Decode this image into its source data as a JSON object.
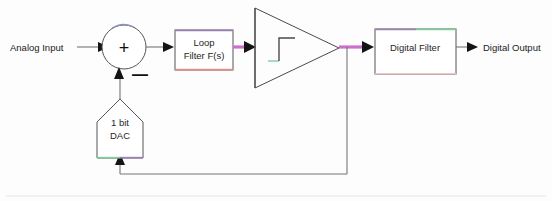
{
  "diagram": {
    "canvas": {
      "width": 552,
      "height": 201,
      "background": "#fdfdfd"
    },
    "labels": {
      "analog_input": "Analog Input",
      "digital_output": "Digital Output",
      "loop_filter_line1": "Loop",
      "loop_filter_line2": "Filter F(s)",
      "dac_line1": "1 bit",
      "dac_line2": "DAC",
      "digital_filter": "Digital Filter",
      "sum_plus": "+",
      "sum_minus": "—"
    },
    "blocks": [
      {
        "name": "summing-junction",
        "shape": "circle",
        "label": "+"
      },
      {
        "name": "loop-filter",
        "shape": "rectangle",
        "label": "Loop Filter F(s)"
      },
      {
        "name": "quantizer",
        "shape": "triangle",
        "label": "step-function"
      },
      {
        "name": "digital-filter",
        "shape": "rectangle",
        "label": "Digital Filter"
      },
      {
        "name": "dac",
        "shape": "pentagon",
        "label": "1 bit DAC"
      }
    ],
    "colors": {
      "wire_magenta": "#cc6fcc",
      "wire_gray": "#767676",
      "outline": "#555555",
      "accent_green": "#7fcf9c",
      "accent_purple": "#9b7fb5",
      "accent_red": "#e08f8f",
      "text": "#262626"
    }
  }
}
